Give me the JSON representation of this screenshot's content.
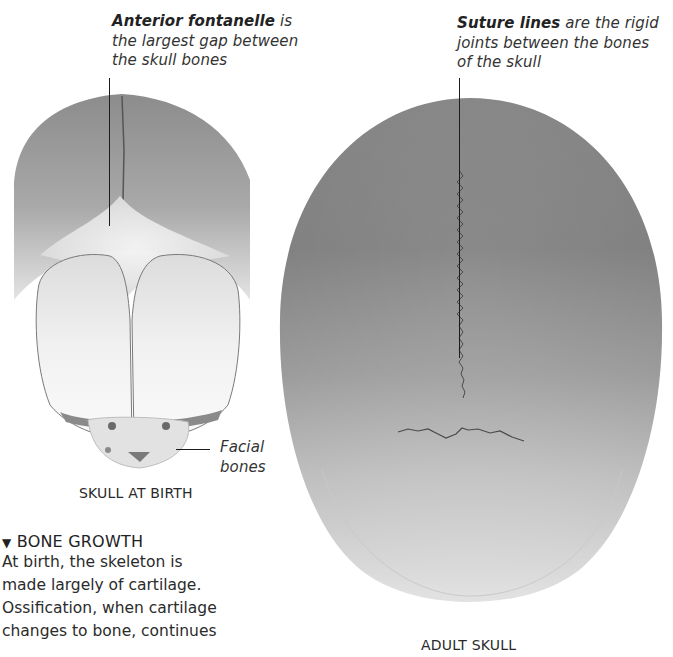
{
  "annotations": {
    "anterior_fontanelle": {
      "term": "Anterior fontanelle",
      "rest_line1": " is",
      "line2": "the largest gap between",
      "line3": "the skull bones"
    },
    "suture_lines": {
      "term": "Suture lines",
      "rest_line1": " are the rigid",
      "line2": "joints between the bones",
      "line3": "of the skull"
    },
    "facial_bones": {
      "line1": "Facial",
      "line2": "bones"
    }
  },
  "labels": {
    "skull_at_birth": "SKULL AT BIRTH",
    "adult_skull": "ADULT SKULL"
  },
  "section": {
    "marker_icon": "▼",
    "heading": "BONE GROWTH",
    "body_lines": [
      "At birth, the skeleton is",
      "made largely of cartilage.",
      "Ossification, when cartilage",
      "changes to bone, continues"
    ]
  },
  "colors": {
    "background": "#ffffff",
    "bone_dark": "#8a8a8a",
    "bone_light": "#f2f2f2",
    "text": "#2a2a2a"
  }
}
